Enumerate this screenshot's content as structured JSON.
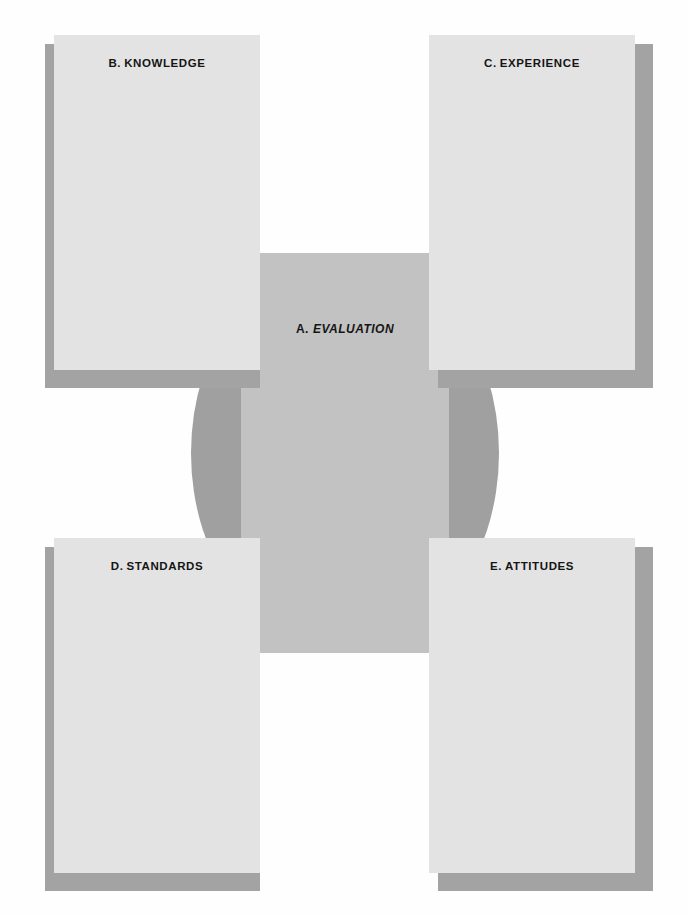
{
  "diagram": {
    "center": {
      "id": "A",
      "prefix": "A.",
      "label": "EVALUATION",
      "shape": "circle",
      "fill_color": "#a0a0a0",
      "band_color": "#c2c2c2"
    },
    "nodes": [
      {
        "id": "B",
        "prefix": "B.",
        "label": "KNOWLEDGE",
        "position": "top-left",
        "shadow": "left",
        "fill_color": "#e3e3e3",
        "shadow_color": "#a3a3a3"
      },
      {
        "id": "C",
        "prefix": "C.",
        "label": "EXPERIENCE",
        "position": "top-right",
        "shadow": "right",
        "fill_color": "#e3e3e3",
        "shadow_color": "#a3a3a3"
      },
      {
        "id": "D",
        "prefix": "D.",
        "label": "STANDARDS",
        "position": "bottom-left",
        "shadow": "left",
        "fill_color": "#e3e3e3",
        "shadow_color": "#a3a3a3"
      },
      {
        "id": "E",
        "prefix": "E.",
        "label": "ATTITUDES",
        "position": "bottom-right",
        "shadow": "right",
        "fill_color": "#e3e3e3",
        "shadow_color": "#a3a3a3"
      }
    ]
  }
}
